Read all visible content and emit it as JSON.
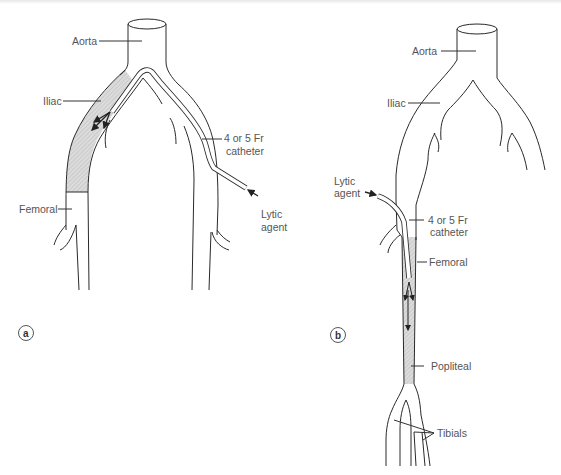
{
  "figure": {
    "panels": [
      {
        "id": "a",
        "panel_label": "a",
        "labels": {
          "aorta": "Aorta",
          "iliac": "Iliac",
          "catheter_line1": "4 or 5 Fr",
          "catheter_line2": "catheter",
          "femoral": "Femoral",
          "lytic_line1": "Lytic",
          "lytic_line2": "agent"
        }
      },
      {
        "id": "b",
        "panel_label": "b",
        "labels": {
          "aorta": "Aorta",
          "iliac": "Iliac",
          "lytic_line1": "Lytic",
          "lytic_line2": "agent",
          "catheter_line1": "4 or 5 Fr",
          "catheter_line2": "catheter",
          "femoral": "Femoral",
          "popliteal": "Popliteal",
          "tibials": "Tibials"
        }
      }
    ],
    "colors": {
      "line": "#2a2a2a",
      "label_text": "#555555",
      "occlusion_hatch_fill": "#d9d9d9",
      "background": "#ffffff"
    }
  }
}
